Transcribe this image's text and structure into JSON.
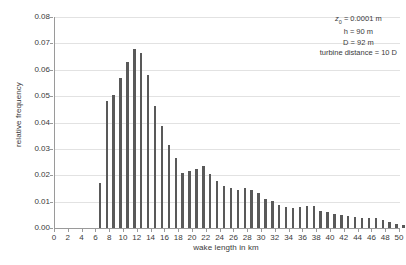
{
  "chart_data": {
    "type": "bar",
    "title": "",
    "subtitle": "",
    "xlabel": "wake length in km",
    "ylabel": "relative frequency",
    "xlim": [
      0,
      50
    ],
    "ylim": [
      0.0,
      0.08
    ],
    "ytick_step": 0.01,
    "xtick_step": 2,
    "grid": "horizontal",
    "legend": "none",
    "bar_color": "#595959",
    "gridline_color": "#e2e2e2",
    "axis_color": "#9a9a9a",
    "bar_width_km": 0.35,
    "x_tick_labels": [
      "0",
      "2",
      "4",
      "6",
      "8",
      "10",
      "12",
      "14",
      "16",
      "18",
      "20",
      "22",
      "24",
      "26",
      "28",
      "30",
      "32",
      "34",
      "36",
      "38",
      "40",
      "42",
      "44",
      "46",
      "48",
      "50"
    ],
    "y_tick_labels": [
      "0.00",
      "0.01",
      "0.02",
      "0.03",
      "0.04",
      "0.05",
      "0.06",
      "0.07",
      "0.08"
    ],
    "x": [
      6.5,
      7.5,
      8.5,
      9.5,
      10.5,
      11.5,
      12.5,
      13.5,
      14.5,
      15.5,
      16.5,
      17.5,
      18.5,
      19.5,
      20.5,
      21.5,
      22.5,
      23.5,
      24.5,
      25.5,
      26.5,
      27.5,
      28.5,
      29.5,
      30.5,
      31.5,
      32.5,
      33.5,
      34.5,
      35.5,
      36.5,
      37.5,
      38.5,
      39.5,
      40.5,
      41.5,
      42.5,
      43.5,
      44.5,
      45.5,
      46.5,
      47.5,
      48.5,
      49.5,
      50.5
    ],
    "values": [
      0.017,
      0.048,
      0.0506,
      0.0568,
      0.063,
      0.0679,
      0.0665,
      0.0581,
      0.0464,
      0.0386,
      0.0316,
      0.0265,
      0.0207,
      0.0217,
      0.0224,
      0.0236,
      0.0206,
      0.018,
      0.016,
      0.015,
      0.0145,
      0.0152,
      0.0143,
      0.0131,
      0.0109,
      0.0101,
      0.0086,
      0.008,
      0.0075,
      0.0081,
      0.0082,
      0.0082,
      0.0066,
      0.0062,
      0.0053,
      0.0048,
      0.0044,
      0.004,
      0.0039,
      0.0038,
      0.0037,
      0.003,
      0.0024,
      0.0017,
      0.0012
    ],
    "annotations": [
      {
        "id": "roughness-length",
        "symbol": "z",
        "subscript": "0",
        "text": " = 0.0001 m"
      },
      {
        "id": "hub-height",
        "text": "h = 90 m"
      },
      {
        "id": "rotor-diameter",
        "text": "D = 92 m"
      },
      {
        "id": "turbine-distance",
        "text": "turbine distance = 10 D"
      }
    ]
  }
}
